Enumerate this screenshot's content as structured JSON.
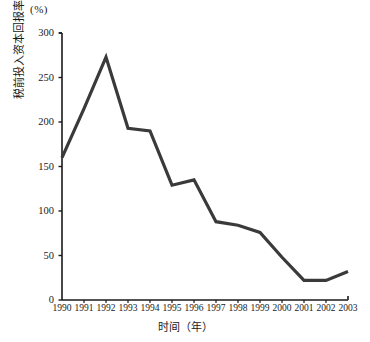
{
  "chart_data": {
    "type": "line",
    "title": "",
    "unit_label": "(%)",
    "xlabel": "时间（年）",
    "ylabel": "税前投入资本回报率",
    "categories": [
      "1990",
      "1991",
      "1992",
      "1993",
      "1994",
      "1995",
      "1996",
      "1997",
      "1998",
      "1999",
      "2000",
      "2001",
      "2002",
      "2003"
    ],
    "values": [
      160,
      215,
      273,
      193,
      190,
      129,
      135,
      88,
      84,
      76,
      48,
      22,
      22,
      32
    ],
    "series": [
      {
        "name": "税前投入资本回报率",
        "values": [
          160,
          215,
          273,
          193,
          190,
          129,
          135,
          88,
          84,
          76,
          48,
          22,
          22,
          32
        ]
      }
    ],
    "ylim": [
      0,
      300
    ],
    "yticks": [
      0,
      50,
      100,
      150,
      200,
      250,
      300
    ],
    "ytick_labels": [
      "0",
      "50",
      "100",
      "150",
      "200",
      "250",
      "300"
    ],
    "xlim": [
      "1990",
      "2003"
    ],
    "grid": false,
    "legend": false,
    "legend_position": "none",
    "line_color": "#3a3a3a",
    "axis_color": "#1a1a1a",
    "background_color": "#ffffff"
  }
}
